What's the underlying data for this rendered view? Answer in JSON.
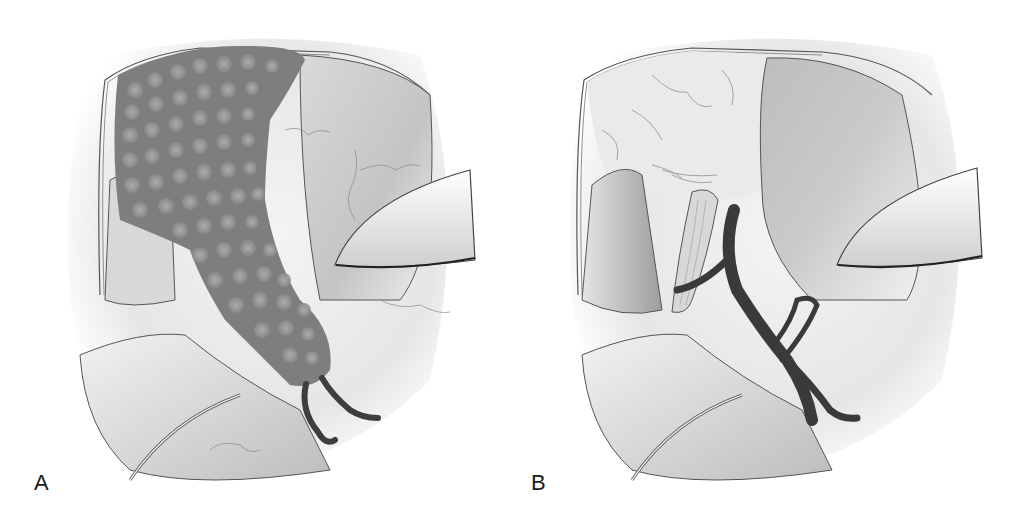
{
  "figure": {
    "panels": [
      {
        "label": "A",
        "content": "tumor-mass-with-vessels"
      },
      {
        "label": "B",
        "content": "exposed-nerve-and-vessels"
      }
    ]
  },
  "colors": {
    "tissue_light": "#efefef",
    "tissue_mid": "#cfcfcf",
    "tissue_dark": "#8c8c8c",
    "mass_base": "#7d7d7d",
    "mass_nodule": "#a8a8a8",
    "vessel": "#3e3e3e",
    "nerve": "#d6d6d6",
    "outline": "#4a4a4a"
  }
}
